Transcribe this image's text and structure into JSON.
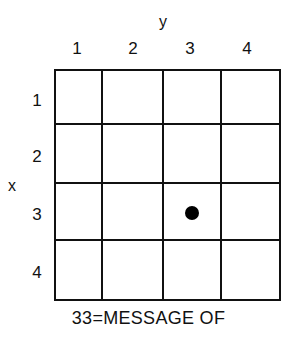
{
  "axes": {
    "y_label": "y",
    "x_label": "x"
  },
  "columns": [
    "1",
    "2",
    "3",
    "4"
  ],
  "rows": [
    "1",
    "2",
    "3",
    "4"
  ],
  "marked_cell": {
    "row": 3,
    "column": 3
  },
  "caption": "33=MESSAGE OF",
  "colors": {
    "lines": "#111111",
    "dot": "#000000",
    "background": "#ffffff"
  }
}
